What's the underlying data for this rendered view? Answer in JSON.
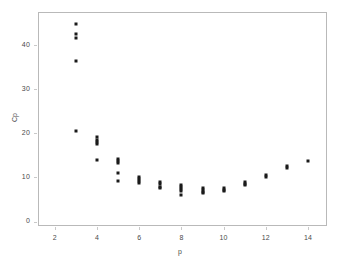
{
  "chart_data": {
    "type": "scatter",
    "title": "",
    "xlabel": "p",
    "ylabel": "Cp",
    "xlim": [
      1.2,
      14.9
    ],
    "ylim": [
      -1.0,
      47.5
    ],
    "xticks": [
      2,
      4,
      6,
      8,
      10,
      12,
      14
    ],
    "yticks": [
      0,
      10,
      20,
      30,
      40
    ],
    "xticklabels": [
      "2",
      "4",
      "6",
      "8",
      "10",
      "12",
      "14"
    ],
    "yticklabels": [
      "0",
      "10",
      "20",
      "30",
      "40"
    ],
    "grid": false,
    "legend": null,
    "marker": "filled-square",
    "marker_color": "#1a1a1a",
    "frame_color": "#b9b9b9",
    "points": [
      {
        "x": 3,
        "y": 44.8
      },
      {
        "x": 3,
        "y": 42.6
      },
      {
        "x": 3,
        "y": 41.5
      },
      {
        "x": 3,
        "y": 36.5
      },
      {
        "x": 3,
        "y": 20.5
      },
      {
        "x": 4,
        "y": 19.1
      },
      {
        "x": 4,
        "y": 18.4
      },
      {
        "x": 4,
        "y": 18.0
      },
      {
        "x": 4,
        "y": 17.6
      },
      {
        "x": 4,
        "y": 13.9
      },
      {
        "x": 5,
        "y": 14.1
      },
      {
        "x": 5,
        "y": 13.7
      },
      {
        "x": 5,
        "y": 13.3
      },
      {
        "x": 5,
        "y": 11.1
      },
      {
        "x": 5,
        "y": 9.2
      },
      {
        "x": 6,
        "y": 10.0
      },
      {
        "x": 6,
        "y": 9.6
      },
      {
        "x": 6,
        "y": 9.2
      },
      {
        "x": 6,
        "y": 8.7
      },
      {
        "x": 7,
        "y": 9.0
      },
      {
        "x": 7,
        "y": 8.6
      },
      {
        "x": 7,
        "y": 7.8
      },
      {
        "x": 7,
        "y": 7.5
      },
      {
        "x": 8,
        "y": 8.3
      },
      {
        "x": 8,
        "y": 7.8
      },
      {
        "x": 8,
        "y": 7.3
      },
      {
        "x": 8,
        "y": 6.9
      },
      {
        "x": 8,
        "y": 6.1
      },
      {
        "x": 9,
        "y": 7.7
      },
      {
        "x": 9,
        "y": 7.2
      },
      {
        "x": 9,
        "y": 6.6
      },
      {
        "x": 9,
        "y": 6.4
      },
      {
        "x": 10,
        "y": 7.6
      },
      {
        "x": 10,
        "y": 7.2
      },
      {
        "x": 10,
        "y": 6.9
      },
      {
        "x": 11,
        "y": 8.9
      },
      {
        "x": 11,
        "y": 8.5
      },
      {
        "x": 11,
        "y": 8.2
      },
      {
        "x": 12,
        "y": 10.5
      },
      {
        "x": 12,
        "y": 10.1
      },
      {
        "x": 13,
        "y": 12.5
      },
      {
        "x": 13,
        "y": 12.1
      },
      {
        "x": 14,
        "y": 13.8
      }
    ]
  }
}
